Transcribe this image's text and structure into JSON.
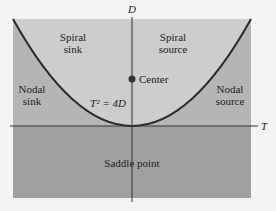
{
  "diagram": {
    "axes": {
      "vertical": "D",
      "horizontal": "T"
    },
    "curve_label": "T² = 4D",
    "regions": {
      "spiral_sink": "Spiral sink",
      "spiral_source": "Spiral source",
      "nodal_sink": "Nodal sink",
      "nodal_source": "Nodal source",
      "saddle": "Saddle point"
    },
    "point_label": "Center",
    "colors": {
      "page_bg": "#f4f4f4",
      "inner_region": "#cdcdcd",
      "outer_region": "#b5b5b5",
      "saddle_region": "#a0a0a0",
      "curve": "#2a2a2a",
      "axis": "#333333"
    }
  }
}
